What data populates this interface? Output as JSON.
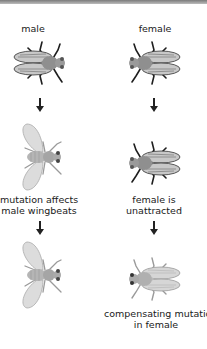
{
  "diagram": {
    "columns": [
      {
        "id": "male",
        "heading": "male",
        "step2_caption_line1": "mutation affects",
        "step2_caption_line2": "male wingbeats",
        "step3_caption_line1": "",
        "step3_caption_line2": ""
      },
      {
        "id": "female",
        "heading": "female",
        "step2_caption_line1": "female is",
        "step2_caption_line2": "unattracted",
        "step3_caption_line1": "compensating mutation",
        "step3_caption_line2": "in female"
      }
    ],
    "colors": {
      "body": "#8f8f8f",
      "wing_dark": "#c8c8c8",
      "wing_light": "#dcdcdc",
      "legs_dark": "#1e1e1e",
      "legs_light": "#9a9a9a",
      "arrow": "#222222"
    }
  }
}
